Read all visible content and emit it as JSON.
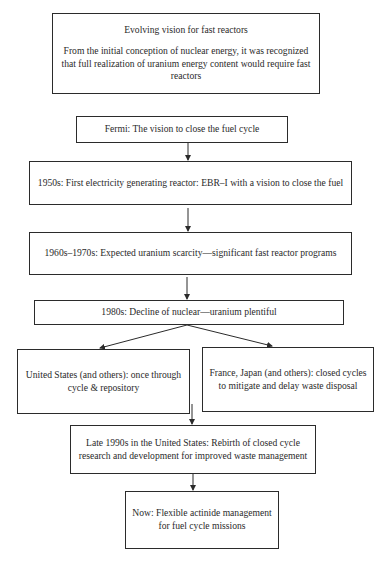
{
  "diagram": {
    "type": "flowchart",
    "nodes": [
      {
        "id": "intro",
        "title": "Evolving vision for fast reactors",
        "text": "From the initial conception of nuclear energy, it was recognized that full realization of uranium energy content would require fast reactors"
      },
      {
        "id": "fermi",
        "text": "Fermi: The vision to close the fuel cycle"
      },
      {
        "id": "1950s",
        "text": "1950s: First electricity generating reactor: EBR–I with a vision to close the fuel"
      },
      {
        "id": "1960s",
        "text": "1960s–1970s: Expected uranium scarcity—significant fast reactor programs"
      },
      {
        "id": "1980s",
        "text": "1980s: Decline of nuclear—uranium plentiful"
      },
      {
        "id": "us",
        "text": "United States (and others): once through cycle & repository"
      },
      {
        "id": "france",
        "text": "France, Japan (and others): closed cycles to mitigate and delay waste disposal"
      },
      {
        "id": "late1990s",
        "text": "Late 1990s in the United States: Rebirth of closed cycle research and development for improved waste management"
      },
      {
        "id": "now",
        "text": "Now: Flexible actinide management for fuel cycle missions"
      }
    ],
    "edges": [
      {
        "from": "fermi",
        "to": "1950s"
      },
      {
        "from": "1950s",
        "to": "1960s"
      },
      {
        "from": "1960s",
        "to": "1980s"
      },
      {
        "from": "1980s",
        "to": "us"
      },
      {
        "from": "1980s",
        "to": "france"
      },
      {
        "from": "us",
        "to": "late1990s"
      },
      {
        "from": "late1990s",
        "to": "now"
      }
    ],
    "line_color": "#2b2b2b"
  }
}
